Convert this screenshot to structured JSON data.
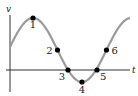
{
  "diagram": {
    "axes": {
      "y_label": "v",
      "x_label": "t"
    },
    "colors": {
      "curve": "#9a9a9a",
      "axis": "#333333",
      "point": "#000000",
      "text": "#1a1a1a"
    },
    "curve": {
      "type": "sinusoid",
      "description": "one full oscillation: starts above mid-level, rises to maximum, falls through zero to minimum, rises back"
    },
    "points": [
      {
        "label": "1",
        "phase": 0.25,
        "note": "maximum"
      },
      {
        "label": "2",
        "phase": 0.5,
        "note": "mid-level, decreasing"
      },
      {
        "label": "3",
        "phase": 0.64,
        "note": "v = 0, decreasing"
      },
      {
        "label": "4",
        "phase": 0.75,
        "note": "minimum"
      },
      {
        "label": "5",
        "phase": 0.86,
        "note": "v = 0, increasing"
      },
      {
        "label": "6",
        "phase": 1.0,
        "note": "mid-level, increasing"
      }
    ]
  }
}
